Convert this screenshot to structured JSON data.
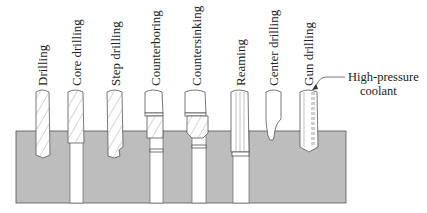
{
  "figure": {
    "workpiece_color": "#bdbdbd",
    "stroke_color": "#555555",
    "operations": [
      {
        "id": "drilling",
        "label": "Drilling"
      },
      {
        "id": "core-drilling",
        "label": "Core drilling"
      },
      {
        "id": "step-drilling",
        "label": "Step drilling"
      },
      {
        "id": "counterboring",
        "label": "Counterboring"
      },
      {
        "id": "countersinking",
        "label": "Countersinking"
      },
      {
        "id": "reaming",
        "label": "Reaming"
      },
      {
        "id": "center-drilling",
        "label": "Center drilling"
      },
      {
        "id": "gun-drilling",
        "label": "Gun drilling"
      }
    ],
    "callout": {
      "line1": "High-pressure",
      "line2": "coolant"
    }
  }
}
